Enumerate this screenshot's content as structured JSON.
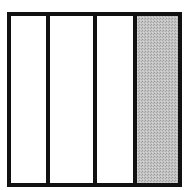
{
  "diagram": {
    "type": "fraction-model",
    "total_parts": 4,
    "shaded_parts": 1,
    "shaded_position": "rightmost",
    "colors": {
      "border": "#111111",
      "shaded_fill": "#b8b8b8",
      "unshaded_fill": "#ffffff"
    }
  }
}
